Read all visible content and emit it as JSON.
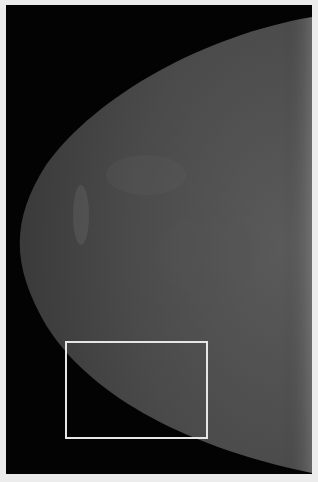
{
  "image": {
    "type": "mammogram",
    "background_color": "#030303",
    "border_color": "#ececec",
    "tissue_color": "#4a4a4a"
  },
  "annotation": {
    "shape": "rectangle",
    "color": "#e6e6e6",
    "x": 65,
    "y": 341,
    "width": 143,
    "height": 98
  }
}
